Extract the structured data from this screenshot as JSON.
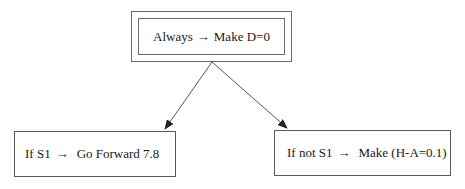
{
  "diagram": {
    "type": "decision-tree",
    "nodes": {
      "root": {
        "condition": "Always",
        "arrow": "→",
        "action": "Make D=0",
        "style": "double-border"
      },
      "left": {
        "condition": "If S1",
        "arrow": "→",
        "action": "Go Forward 7.8"
      },
      "right": {
        "condition": "If not S1",
        "arrow": "→",
        "action": "Make (H-A=0.1)"
      }
    },
    "edges": [
      {
        "from": "root",
        "to": "left"
      },
      {
        "from": "root",
        "to": "right"
      }
    ],
    "colors": {
      "line": "#555555",
      "text": "#1a1a1a",
      "background": "#ffffff"
    }
  }
}
